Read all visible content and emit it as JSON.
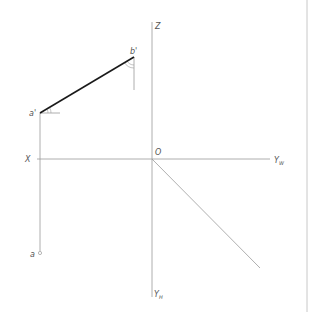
{
  "diagram": {
    "type": "orthographic-projection",
    "colors": {
      "background": "#ffffff",
      "thin_line": "#9a9a9a",
      "thick_line": "#1a1a1a",
      "label": "#555555",
      "border": "#c8c8c8"
    },
    "axes": {
      "origin_label": "O",
      "x_label": "X",
      "z_label": "Z",
      "yw_label": "Y",
      "yw_sub": "W",
      "yh_label": "Y",
      "yh_sub": "H"
    },
    "points": {
      "a_prime": "a'",
      "b_prime": "b'",
      "a": "a"
    }
  }
}
